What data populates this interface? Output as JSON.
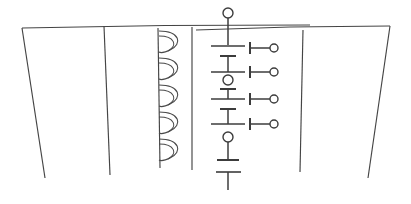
{
  "figure": {
    "canvas": {
      "width": 411,
      "height": 204
    },
    "background_color": "#ffffff",
    "ink_color": "#3c3c3c",
    "line_color_light": "#4a4a4a"
  },
  "panels": {
    "left_outline": {
      "name": "left-panel-outline",
      "top_edge": "M 22,28 L 310,25",
      "left_edge": "M 22,28 L 45,178",
      "inner_divider": "M 104,26 L 110,175"
    },
    "right_outline": {
      "name": "right-panel-outline",
      "top_edge": "M 196,30 L 390,26",
      "right_edge": "M 390,26 L 368,178",
      "inner_divider": "M 303,30 L 300,172"
    },
    "core_left_edge": "M 158,30 L 160,168",
    "core_right_edge": "M 192,27 L 192,170"
  },
  "coil": {
    "name": "inductor-coil",
    "loop_count": 5,
    "x_center": 170,
    "top_y": 30,
    "bottom_y": 166,
    "loop_height": 27,
    "loop_width": 22
  },
  "battery_stack": {
    "name": "battery-cell-column",
    "cell_count": 4,
    "column_x": 228,
    "top_terminal": {
      "cx": 228,
      "cy": 13,
      "r": 5
    },
    "top_lead": "M 228,18 L 228,44",
    "bottom_lead": "M 228,140 L 228,158",
    "bottom_terminal_plate": "M 216,171 L 240,171",
    "bottom_stub": "M 228,158 L 228,188",
    "cells": [
      {
        "index": 1,
        "long_plate_y": 46,
        "short_plate_y": 56
      },
      {
        "index": 2,
        "long_plate_y": 72,
        "short_plate_y": 82
      },
      {
        "index": 3,
        "long_plate_y": 99,
        "short_plate_y": 109
      },
      {
        "index": 4,
        "long_plate_y": 125,
        "short_plate_y": 135
      }
    ],
    "mid_node_dot": {
      "cx": 228,
      "cy": 78,
      "r": 5
    },
    "low_node_dot": {
      "cx": 228,
      "cy": 137,
      "r": 5
    },
    "plate_long_half_width": 17,
    "plate_short_half_width": 8
  },
  "taps": {
    "name": "output-taps",
    "count": 4,
    "items": [
      {
        "index": 1,
        "label": "tap-1",
        "y": 48,
        "stub_x": 245,
        "wire_end_x": 270,
        "dot_cx": 274,
        "dot_r": 4
      },
      {
        "index": 2,
        "label": "tap-2",
        "y": 72,
        "stub_x": 245,
        "wire_end_x": 270,
        "dot_cx": 274,
        "dot_r": 4
      },
      {
        "index": 3,
        "label": "tap-3",
        "y": 97,
        "stub_x": 245,
        "wire_end_x": 270,
        "dot_cx": 274,
        "dot_r": 4
      },
      {
        "index": 4,
        "label": "tap-4",
        "y": 122,
        "stub_x": 245,
        "wire_end_x": 270,
        "dot_cx": 274,
        "dot_r": 4
      }
    ]
  }
}
